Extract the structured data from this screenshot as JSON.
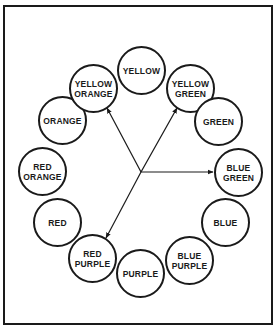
{
  "diagram": {
    "type": "color-wheel",
    "circles": [
      {
        "label": "YELLOW",
        "cx": 141,
        "cy": 70
      },
      {
        "label": "YELLOW\nGREEN",
        "cx": 190,
        "cy": 88
      },
      {
        "label": "GREEN",
        "cx": 218,
        "cy": 121
      },
      {
        "label": "BLUE\nGREEN",
        "cx": 238,
        "cy": 172
      },
      {
        "label": "BLUE",
        "cx": 225,
        "cy": 222
      },
      {
        "label": "BLUE\nPURPLE",
        "cx": 189,
        "cy": 260
      },
      {
        "label": "PURPLE",
        "cx": 140,
        "cy": 273
      },
      {
        "label": "RED\nPURPLE",
        "cx": 92,
        "cy": 258
      },
      {
        "label": "RED",
        "cx": 57,
        "cy": 222
      },
      {
        "label": "RED\nORANGE",
        "cx": 42,
        "cy": 171
      },
      {
        "label": "ORANGE",
        "cx": 62,
        "cy": 120
      },
      {
        "label": "YELLOW\nORANGE",
        "cx": 93,
        "cy": 88
      }
    ],
    "arrows": {
      "origin": {
        "x": 141,
        "y": 172
      },
      "targets": [
        {
          "to": "YELLOW ORANGE",
          "x": 107,
          "y": 108
        },
        {
          "to": "YELLOW GREEN",
          "x": 177,
          "y": 108
        },
        {
          "to": "BLUE GREEN",
          "x": 213,
          "y": 172
        },
        {
          "to": "RED PURPLE",
          "x": 106,
          "y": 238
        }
      ]
    },
    "colors": {
      "stroke": "#1a1a1a",
      "background": "#ffffff"
    }
  }
}
